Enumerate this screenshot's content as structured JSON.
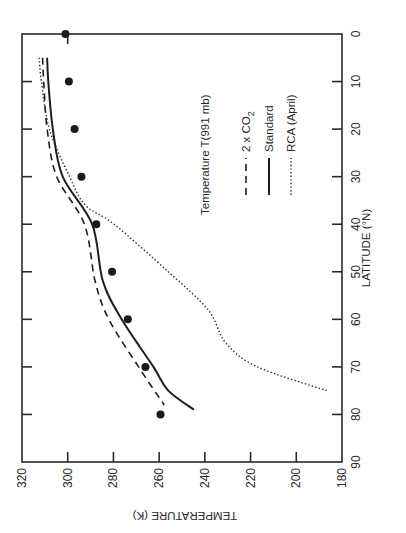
{
  "chart_data": {
    "type": "line",
    "orientation": "rotated 90° (latitude runs top-to-bottom on right axis, temperature runs right-to-left on bottom axis)",
    "title": "Temperature T(991 mb)",
    "xlabel": "LATITUDE (°N)",
    "ylabel": "TEMPERATURE (K)",
    "xlim": [
      0,
      90
    ],
    "ylim": [
      180,
      320
    ],
    "x_ticks": [
      0,
      10,
      20,
      30,
      40,
      50,
      60,
      70,
      80,
      90
    ],
    "y_ticks": [
      180,
      200,
      220,
      240,
      260,
      280,
      300,
      320
    ],
    "grid": false,
    "legend_position": "inside, upper-middle",
    "series": [
      {
        "name": "2 x CO2",
        "style": "dashed",
        "x": [
          5,
          10,
          20,
          30,
          40,
          52,
          60,
          70,
          78
        ],
        "values": [
          311,
          310.5,
          309,
          304.8,
          292.7,
          288,
          282,
          269,
          257.8
        ]
      },
      {
        "name": "Standard",
        "style": "solid",
        "x": [
          5,
          10,
          20,
          30,
          40,
          52,
          60,
          70,
          75,
          79
        ],
        "values": [
          309,
          308.5,
          306.5,
          302.2,
          289.3,
          284.6,
          276.4,
          262.5,
          256,
          244.8
        ]
      },
      {
        "name": "RCA (April)",
        "style": "dotted",
        "x": [
          5,
          10,
          20,
          30,
          36,
          40,
          50,
          58,
          65,
          70,
          75
        ],
        "values": [
          312.5,
          311.5,
          308,
          299.2,
          292.3,
          279.7,
          256,
          238.6,
          230.8,
          217,
          186.7
        ]
      },
      {
        "name": "Observed",
        "style": "markers",
        "x": [
          0,
          10,
          20,
          30,
          40,
          50,
          60,
          70,
          80
        ],
        "values": [
          301,
          299.5,
          297,
          294,
          287.5,
          280.6,
          273.7,
          266,
          259.4
        ]
      }
    ]
  },
  "labels": {
    "x_axis_title": "LATITUDE (°N)",
    "y_axis_title": "TEMPERATURE (K)",
    "legend_title": "Temperature T(991 mb)",
    "legend": [
      {
        "name": "2 x CO",
        "subscript": "2",
        "style": "dashed"
      },
      {
        "name": "Standard",
        "style": "solid"
      },
      {
        "name": "RCA (April)",
        "style": "dotted"
      }
    ],
    "lat_ticks": [
      "0",
      "10",
      "20",
      "30",
      "40",
      "50",
      "60",
      "70",
      "80",
      "90"
    ],
    "temp_ticks": [
      "320",
      "300",
      "280",
      "260",
      "240",
      "220",
      "200",
      "180"
    ]
  }
}
